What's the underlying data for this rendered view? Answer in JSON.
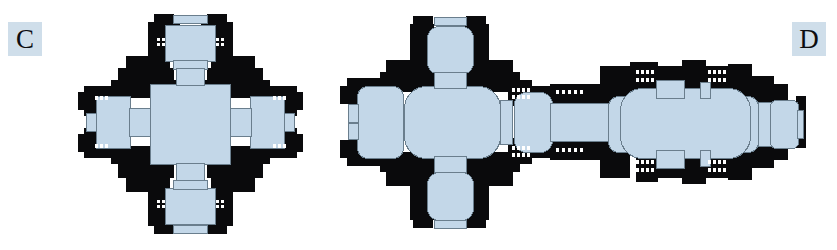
{
  "figure": {
    "type": "architectural-floor-plans",
    "background_color": "#ffffff",
    "wall_color": "#0a0a0c",
    "interior_fill_color": "#c3d7e8",
    "interior_stroke_color": "#6a7e8d",
    "opening_color": "#ffffff",
    "label_background_color": "#cfdeea",
    "label_text_color": "#0d0d10",
    "panels": [
      {
        "id": "C",
        "label": "C",
        "description": "centralized quatrefoil cross plan with square domed core and four equal arms"
      },
      {
        "id": "D",
        "label": "D",
        "description": "centralized cross plan with three apsed arms joined eastward by a corridor to a longitudinal aisled nave ending in an apse"
      }
    ]
  },
  "labels": {
    "c": "C",
    "d": "D"
  }
}
